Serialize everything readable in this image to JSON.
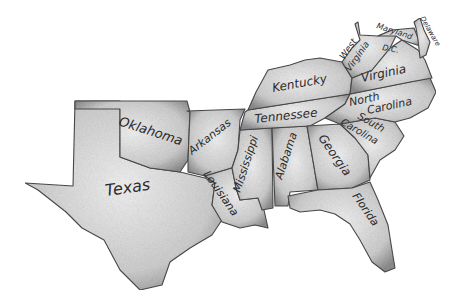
{
  "map": {
    "title": "Southern United States",
    "style": "pencil sketch",
    "colors": {
      "background": "#ffffff",
      "fill_light": "#e8e8e8",
      "fill_dark": "#9a9a9a",
      "outline": "#4a4a4a",
      "text": "#2a2a2a"
    },
    "states": [
      {
        "id": "texas",
        "label": "Texas"
      },
      {
        "id": "oklahoma",
        "label": "Oklahoma"
      },
      {
        "id": "arkansas",
        "label": "Arkansas"
      },
      {
        "id": "louisiana",
        "label": "Louisiana"
      },
      {
        "id": "mississippi",
        "label": "Mississippi"
      },
      {
        "id": "alabama",
        "label": "Alabama"
      },
      {
        "id": "tennessee",
        "label": "Tennessee"
      },
      {
        "id": "kentucky",
        "label": "Kentucky"
      },
      {
        "id": "georgia",
        "label": "Georgia"
      },
      {
        "id": "florida",
        "label": "Florida"
      },
      {
        "id": "south-carolina",
        "label_line1": "South",
        "label_line2": "Carolina"
      },
      {
        "id": "north-carolina",
        "label_line1": "North",
        "label_line2": "Carolina"
      },
      {
        "id": "virginia",
        "label": "Virginia"
      },
      {
        "id": "west-virginia",
        "label_line1": "West",
        "label_line2": "Virginia"
      },
      {
        "id": "maryland",
        "label": "Maryland"
      },
      {
        "id": "delaware",
        "label": "Delaware"
      },
      {
        "id": "dc",
        "label": "D.C."
      }
    ]
  }
}
